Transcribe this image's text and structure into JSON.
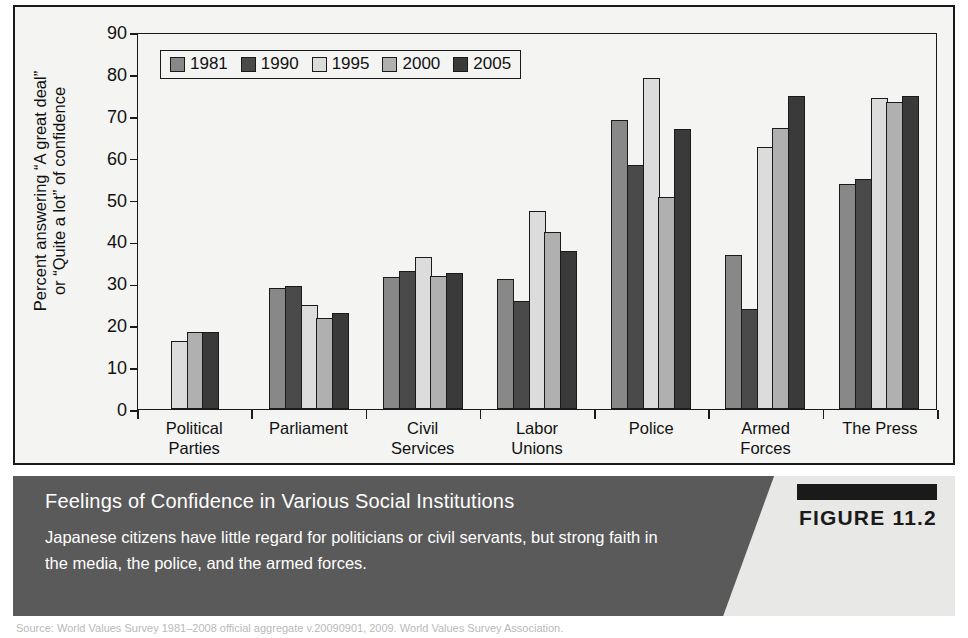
{
  "figure": {
    "number_label": "FIGURE 11.2",
    "caption_title": "Feelings of Confidence in Various Social Institutions",
    "caption_body": "Japanese citizens have little regard for politicians or civil servants, but strong faith in the media, the police, and the armed forces.",
    "source_line": "Source: World Values Survey 1981–2008 official aggregate v.20090901, 2009. World Values Survey Association."
  },
  "colors": {
    "series": [
      "#888888",
      "#4a4a4a",
      "#dcdcdc",
      "#b0b0b0",
      "#3a3a3a"
    ],
    "panel_background": "#f4f4f2",
    "axis": "#1a1a1a",
    "caption_band": "#5a5a5a",
    "caption_text": "#ffffff",
    "figure_tab": "#1a1a1a"
  },
  "chart_data": {
    "type": "bar",
    "title": "",
    "xlabel": "",
    "ylabel_line1": "Percent answering “A great deal”",
    "ylabel_line2": "or “Quite a lot” of confidence",
    "ylim": [
      0,
      90
    ],
    "yticks": [
      0,
      10,
      20,
      30,
      40,
      50,
      60,
      70,
      80,
      90
    ],
    "grid": false,
    "legend_position": "top-left inside plot",
    "categories": [
      [
        "Political",
        "Parties"
      ],
      [
        "Parliament",
        ""
      ],
      [
        "Civil",
        "Services"
      ],
      [
        "Labor",
        "Unions"
      ],
      [
        "Police",
        ""
      ],
      [
        "Armed",
        "Forces"
      ],
      [
        "The Press",
        ""
      ]
    ],
    "category_names": [
      "Political Parties",
      "Parliament",
      "Civil Services",
      "Labor Unions",
      "Police",
      "Armed Forces",
      "The Press"
    ],
    "series": [
      {
        "name": "1981",
        "values": [
          null,
          29.0,
          31.5,
          31.0,
          69.0,
          36.8,
          53.7
        ]
      },
      {
        "name": "1990",
        "values": [
          null,
          29.4,
          33.0,
          25.7,
          58.3,
          23.8,
          55.0
        ]
      },
      {
        "name": "1995",
        "values": [
          16.3,
          24.8,
          36.3,
          47.3,
          79.0,
          62.5,
          74.2
        ]
      },
      {
        "name": "2000",
        "values": [
          18.4,
          21.8,
          31.8,
          42.3,
          50.5,
          67.0,
          73.2
        ]
      },
      {
        "name": "2005",
        "values": [
          18.5,
          23.0,
          32.5,
          37.8,
          66.8,
          74.8,
          74.8
        ]
      }
    ]
  }
}
